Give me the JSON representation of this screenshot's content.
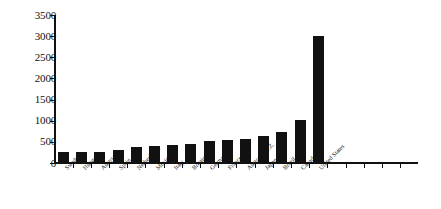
{
  "chart_data": {
    "type": "bar",
    "title": "",
    "subtitle": "",
    "xlabel": "",
    "ylabel": "",
    "ylim": [
      0,
      3500
    ],
    "ytick_step": 500,
    "yticks": [
      0,
      500,
      1000,
      1500,
      2000,
      2500,
      3000,
      3500
    ],
    "ytick_labels": [
      "0",
      "500",
      "1000",
      "1500",
      "2000",
      "2500",
      "3000",
      "3500"
    ],
    "grid": false,
    "legend": false,
    "legend_position": "none",
    "bar_color": "#111111",
    "axis_color": "#111111",
    "categories": [
      "Sweden",
      "Hungary",
      "Austria",
      "Spain",
      "Netherlands",
      "Mexico",
      "Italy",
      "Britain",
      "Germany",
      "France",
      "Australia/N.Z.",
      "Japan",
      "Brazil",
      "Canada",
      "United States"
    ],
    "values": [
      260,
      250,
      260,
      310,
      380,
      400,
      420,
      450,
      520,
      540,
      560,
      650,
      740,
      1020,
      3000
    ]
  }
}
